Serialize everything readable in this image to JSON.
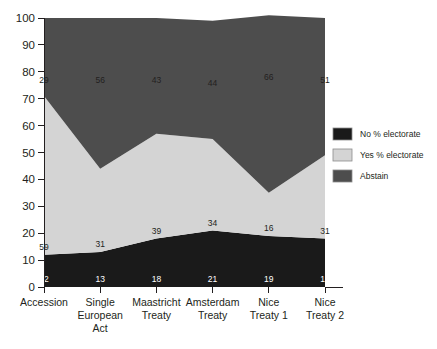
{
  "chart_data": {
    "type": "area",
    "title": "",
    "subtitle": "",
    "xlabel": "",
    "ylabel": "",
    "stacked": true,
    "grid": false,
    "legend_position": "right",
    "ylim": [
      0,
      100
    ],
    "ytick_step": 10,
    "yticks": [
      "0",
      "10",
      "20",
      "30",
      "40",
      "50",
      "60",
      "70",
      "80",
      "90",
      "100"
    ],
    "categories": [
      "Accession",
      "Single European Act",
      "Maastricht Treaty",
      "Amsterdam Treaty",
      "Nice Treaty 1",
      "Nice Treaty 2"
    ],
    "category_lines": [
      [
        "Accession"
      ],
      [
        "Single",
        "European",
        "Act"
      ],
      [
        "Maastricht",
        "Treaty"
      ],
      [
        "Amsterdam",
        "Treaty"
      ],
      [
        "Nice",
        "Treaty 1"
      ],
      [
        "Nice",
        "Treaty 2"
      ]
    ],
    "series": [
      {
        "name": "No % electorate",
        "color": "#1a1a1a",
        "label_color": "#ffffff",
        "values": [
          12,
          13,
          18,
          21,
          19,
          18
        ]
      },
      {
        "name": "Yes % electorate",
        "color": "#d4d4d4",
        "label_color": "#231f20",
        "values": [
          59,
          31,
          39,
          34,
          16,
          31
        ]
      },
      {
        "name": "Abstain",
        "color": "#4d4d4d",
        "label_color": "#231f20",
        "values": [
          29,
          56,
          43,
          44,
          66,
          51
        ]
      }
    ]
  },
  "legend": {
    "items": [
      {
        "label": "No % electorate",
        "swatch": "#1a1a1a"
      },
      {
        "label": "Yes % electorate",
        "swatch": "#d4d4d4"
      },
      {
        "label": "Abstain",
        "swatch": "#4d4d4d"
      }
    ]
  },
  "axis": {
    "y_values": [
      100,
      90,
      80,
      70,
      60,
      50,
      40,
      30,
      20,
      10,
      0
    ]
  }
}
